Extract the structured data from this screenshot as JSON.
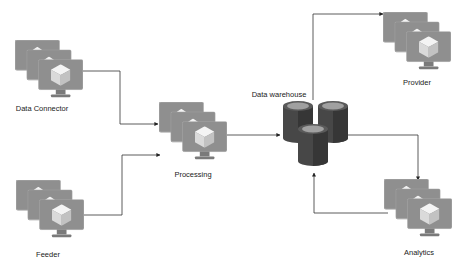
{
  "diagram": {
    "type": "data-flow",
    "colors": {
      "monitor": "#8c8c8c",
      "monitor_edge": "#a3a3a3",
      "monitor_stand": "#777777",
      "cube_light": "#f2f2f2",
      "cube_mid": "#d6d6d6",
      "cube_dark": "#bdbdbd",
      "cylinder_body": "#4a4a4a",
      "cylinder_dark": "#353535",
      "cylinder_top": "#9a9a9a",
      "connector": "#333333"
    },
    "nodes": [
      {
        "id": "data_connector",
        "label": "Data Connector",
        "kind": "server-stack"
      },
      {
        "id": "feeder",
        "label": "Feeder",
        "kind": "server-stack"
      },
      {
        "id": "processing",
        "label": "Processing",
        "kind": "server-stack"
      },
      {
        "id": "data_warehouse",
        "label": "Data warehouse",
        "kind": "database-cluster"
      },
      {
        "id": "provider",
        "label": "Provider",
        "kind": "server-stack"
      },
      {
        "id": "analytics",
        "label": "Analytics",
        "kind": "server-stack"
      }
    ],
    "edges": [
      {
        "from": "Data Connector",
        "to": "Processing"
      },
      {
        "from": "Feeder",
        "to": "Processing"
      },
      {
        "from": "Processing",
        "to": "Data warehouse"
      },
      {
        "from": "Data warehouse",
        "to": "Provider"
      },
      {
        "from": "Data warehouse",
        "to": "Analytics"
      },
      {
        "from": "Analytics",
        "to": "Data warehouse"
      }
    ]
  }
}
